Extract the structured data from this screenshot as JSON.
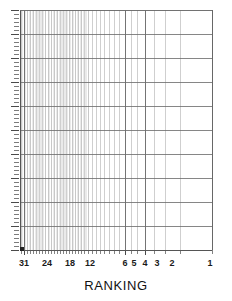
{
  "chart_data": {
    "type": "line",
    "title": "",
    "subtitle": "",
    "xlabel": "RANKING",
    "ylabel": "",
    "grid": true,
    "legend_position": "none",
    "x_axis": {
      "label": "RANKING",
      "scale": "log-reversed",
      "tick_labels": [
        "31",
        "24",
        "18",
        "12",
        "6",
        "5",
        "4",
        "3",
        "2",
        "1"
      ],
      "tick_values": [
        31,
        24,
        18,
        12,
        6,
        5,
        4,
        3,
        2,
        1
      ],
      "tick_label_x_px": [
        24,
        47,
        70,
        90,
        125,
        134,
        145,
        157,
        172,
        210
      ],
      "minor_tick_x_px": [
        21,
        24,
        27,
        30,
        33,
        36,
        39,
        42,
        45,
        48,
        51,
        54,
        57,
        60,
        63,
        66,
        69,
        72,
        75,
        78,
        81,
        84,
        88,
        92,
        96,
        100,
        104,
        109,
        114,
        119,
        125,
        131,
        137,
        145,
        154,
        165,
        180,
        212
      ],
      "range_left_to_right": [
        31,
        1
      ],
      "axis_min_px": 20,
      "axis_max_px": 212
    },
    "y_axis": {
      "label": "",
      "scale": "log",
      "tick_labels": [],
      "major_gridline_y_px": [
        10,
        34,
        58,
        82,
        106,
        130,
        154,
        178,
        202,
        226,
        250
      ],
      "minor_tick_count": 64,
      "axis_top_px": 10,
      "axis_bottom_px": 250
    },
    "series": [
      {
        "name": "data-point",
        "points": [
          {
            "x_px": 22,
            "y_px": 249
          }
        ],
        "marker": "square",
        "values": []
      }
    ],
    "colors": {
      "background": "#ffffff",
      "major_gridline": "#6e6e6e",
      "vertical_major_line": "#555555",
      "vertical_minor_line": "#b9b9b9",
      "axis_line": "#555555",
      "tick_mark": "#4a4a4a",
      "label_text": "#1a1a1a",
      "title_text": "#111111",
      "marker": "#222222"
    }
  },
  "axis_title": {
    "text": "RANKING"
  },
  "x_labels": [
    {
      "text": "31",
      "x": 24
    },
    {
      "text": "24",
      "x": 47
    },
    {
      "text": "18",
      "x": 70
    },
    {
      "text": "12",
      "x": 90
    },
    {
      "text": "6",
      "x": 125
    },
    {
      "text": "5",
      "x": 134
    },
    {
      "text": "4",
      "x": 145
    },
    {
      "text": "3",
      "x": 157
    },
    {
      "text": "2",
      "x": 172
    },
    {
      "text": "1",
      "x": 210
    }
  ]
}
